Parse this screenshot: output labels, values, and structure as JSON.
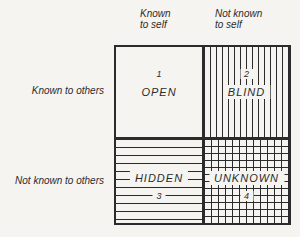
{
  "colors": {
    "ink": "#2b2b2b",
    "paper": "#f5f4f1"
  },
  "diagram": {
    "name": "Johari Window",
    "column_headers": {
      "left": "Known\nto self",
      "right": "Not known\nto self"
    },
    "row_headers": {
      "top": "Known to others",
      "bottom": "Not known to others"
    },
    "quadrants": {
      "open": {
        "number": "1",
        "label": "OPEN",
        "pattern": "none"
      },
      "blind": {
        "number": "2",
        "label": "BLIND",
        "pattern": "vertical-lines"
      },
      "hidden": {
        "number": "3",
        "label": "HIDDEN",
        "pattern": "horizontal-lines"
      },
      "unknown": {
        "number": "4",
        "label": "UNKNOWN",
        "pattern": "crosshatch-grid"
      }
    }
  }
}
